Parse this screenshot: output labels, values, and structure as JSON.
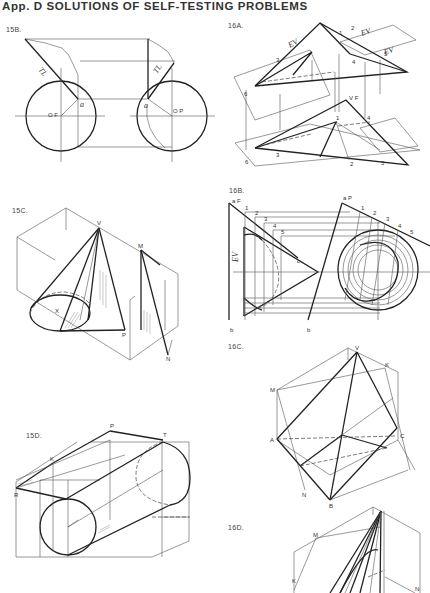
{
  "page": {
    "title": "App. D   SOLUTIONS OF SELF-TESTING PROBLEMS"
  },
  "figures": [
    {
      "id": "15B",
      "label": "15B.",
      "annotations": [
        "TL",
        "TL",
        "a",
        "a",
        "O F",
        "O P"
      ]
    },
    {
      "id": "16A",
      "label": "16A.",
      "annotations": [
        "EV",
        "EV",
        "EV",
        "1",
        "2",
        "3",
        "4",
        "5",
        "6",
        "6",
        "1",
        "2",
        "3",
        "4",
        "5",
        "V F"
      ]
    },
    {
      "id": "15C",
      "label": "15C.",
      "annotations": [
        "V",
        "M",
        "X",
        "P",
        "N"
      ]
    },
    {
      "id": "16B",
      "label": "16B.",
      "annotations": [
        "a F",
        "a P",
        "EV",
        "1",
        "2",
        "3",
        "4",
        "5",
        "c",
        "b",
        "b",
        "1",
        "2",
        "3",
        "4",
        "5"
      ]
    },
    {
      "id": "16C",
      "label": "16C.",
      "annotations": [
        "V",
        "K",
        "M",
        "A",
        "C",
        "N",
        "B"
      ]
    },
    {
      "id": "15D",
      "label": "15D.",
      "annotations": [
        "P",
        "T",
        "K",
        "R"
      ]
    },
    {
      "id": "16D",
      "label": "16D.",
      "annotations": [
        "M",
        "K",
        "N"
      ]
    }
  ],
  "colors": {
    "ink": "#222222",
    "paper": "#ffffff"
  }
}
